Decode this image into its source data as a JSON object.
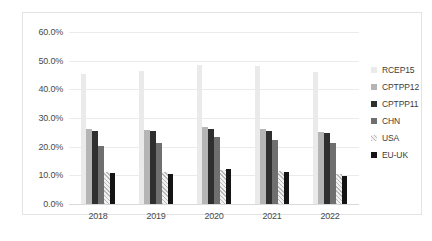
{
  "chart_data": {
    "type": "bar",
    "title": "",
    "subtitle": "",
    "xlabel": "",
    "ylabel": "",
    "categories": [
      "2018",
      "2019",
      "2020",
      "2021",
      "2022"
    ],
    "ylim": [
      0,
      60
    ],
    "ytick_labels": [
      "0.0%",
      "10.0%",
      "20.0%",
      "30.0%",
      "40.0%",
      "50.0%",
      "60.0%"
    ],
    "ytick_values": [
      0,
      10,
      20,
      30,
      40,
      50,
      60
    ],
    "grid": true,
    "legend_position": "right",
    "value_suffix": "%",
    "series": [
      {
        "name": "RCEP15",
        "color": "#eaeaea",
        "values": [
          45.2,
          46.3,
          48.5,
          48.0,
          46.2
        ]
      },
      {
        "name": "CPTPP12",
        "color": "#b5b5b5",
        "values": [
          26.0,
          25.8,
          26.8,
          26.2,
          25.2
        ]
      },
      {
        "name": "CPTPP11",
        "color": "#2f2f2f",
        "values": [
          25.4,
          25.3,
          26.3,
          25.5,
          24.6
        ]
      },
      {
        "name": "CHN",
        "color": "#6f6f6f",
        "values": [
          20.3,
          21.3,
          23.5,
          22.3,
          21.2
        ]
      },
      {
        "name": "USA",
        "color": "#e2e2e2",
        "values": [
          11.2,
          11.0,
          12.0,
          11.5,
          10.5
        ]
      },
      {
        "name": "EU-UK",
        "color": "#141414",
        "values": [
          10.8,
          10.3,
          12.1,
          11.0,
          9.6
        ]
      }
    ]
  },
  "legend": {
    "items": [
      {
        "label": "RCEP15"
      },
      {
        "label": "CPTPP12"
      },
      {
        "label": "CPTPP11"
      },
      {
        "label": "CHN"
      },
      {
        "label": "USA"
      },
      {
        "label": "EU-UK"
      }
    ]
  }
}
